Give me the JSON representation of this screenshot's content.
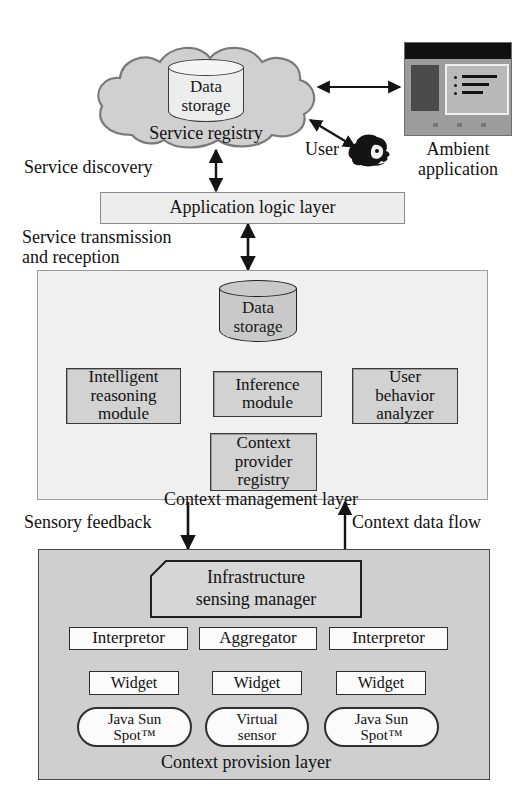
{
  "figure": {
    "background_color": "#ffffff"
  },
  "top_layer": {
    "cloud": {
      "name": "service-registry-cloud",
      "label": "Service registry",
      "datastore_label_line1": "Data",
      "datastore_label_line2": "storage",
      "fill": "#d0d0d0"
    },
    "monitor": {
      "label_line1": "Ambient",
      "label_line2": "application"
    },
    "user": {
      "label": "User"
    }
  },
  "edge_labels": {
    "service_discovery": "Service discovery",
    "service_transmission_line1": "Service transmission",
    "service_transmission_line2": "and reception",
    "sensory_feedback": "Sensory feedback",
    "context_data_flow": "Context data flow"
  },
  "application_layer": {
    "label": "Application logic layer"
  },
  "context_management_layer": {
    "label": "Context management layer",
    "datastore_label_line1": "Data",
    "datastore_label_line2": "storage",
    "modules": [
      {
        "id": "intelligent-reasoning-module",
        "lines": [
          "Intelligent",
          "reasoning",
          "module"
        ]
      },
      {
        "id": "inference-module",
        "lines": [
          "Inference",
          "module"
        ]
      },
      {
        "id": "user-behavior-analyzer",
        "lines": [
          "User",
          "behavior",
          "analyzer"
        ]
      },
      {
        "id": "context-provider-registry",
        "lines": [
          "Context",
          "provider",
          "registry"
        ]
      }
    ]
  },
  "context_provision_layer": {
    "label": "Context provision layer",
    "manager": {
      "lines": [
        "Infrastructure",
        "sensing manager"
      ]
    },
    "processors": [
      {
        "id": "interpretor-left",
        "label": "Interpretor"
      },
      {
        "id": "aggregator",
        "label": "Aggregator"
      },
      {
        "id": "interpretor-right",
        "label": "Interpretor"
      }
    ],
    "widgets": [
      {
        "id": "widget-left",
        "label": "Widget"
      },
      {
        "id": "widget-middle",
        "label": "Widget"
      },
      {
        "id": "widget-right",
        "label": "Widget"
      }
    ],
    "sensors": [
      {
        "id": "sensor-left",
        "lines": [
          "Java Sun",
          "Spot™"
        ]
      },
      {
        "id": "sensor-middle",
        "lines": [
          "Virtual",
          "sensor"
        ]
      },
      {
        "id": "sensor-right",
        "lines": [
          "Java Sun",
          "Spot™"
        ]
      }
    ]
  },
  "colors": {
    "panel_light": "#f0f0f0",
    "panel_gray": "#cfcfcf",
    "box_gray": "#d2d2d2",
    "box_white": "#fbfbfb",
    "stroke": "#141414"
  }
}
